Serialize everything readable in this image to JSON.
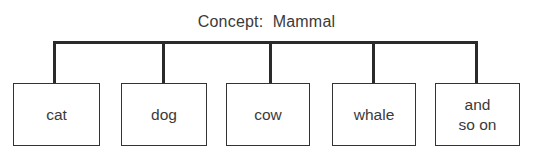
{
  "diagram": {
    "title": "Concept:  Mammal",
    "instances": [
      {
        "label": "cat",
        "left": 13,
        "width": 87,
        "stem_x": 53
      },
      {
        "label": "dog",
        "left": 121,
        "width": 86,
        "stem_x": 162
      },
      {
        "label": "cow",
        "left": 226,
        "width": 84,
        "stem_x": 269
      },
      {
        "label": "whale",
        "left": 332,
        "width": 84,
        "stem_x": 372
      },
      {
        "label": "and\nso on",
        "left": 435,
        "width": 85,
        "stem_x": 475
      }
    ],
    "colors": {
      "line": "#2a2a2a",
      "text": "#3a3a3a",
      "background": "#ffffff"
    }
  }
}
